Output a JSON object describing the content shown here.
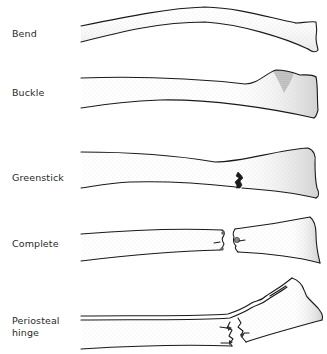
{
  "figure": {
    "rows": [
      {
        "id": "bend",
        "label": "Bend"
      },
      {
        "id": "buckle",
        "label": "Buckle"
      },
      {
        "id": "greenstick",
        "label": "Greenstick"
      },
      {
        "id": "complete",
        "label": "Complete"
      },
      {
        "id": "periosteal-hinge",
        "label_line1": "Periosteal",
        "label_line2": "hinge"
      }
    ]
  },
  "colors": {
    "outline": "#1a1a1a",
    "stipple": "#9a9a9a",
    "label_text": "#2a2a2a",
    "background": "#ffffff"
  }
}
